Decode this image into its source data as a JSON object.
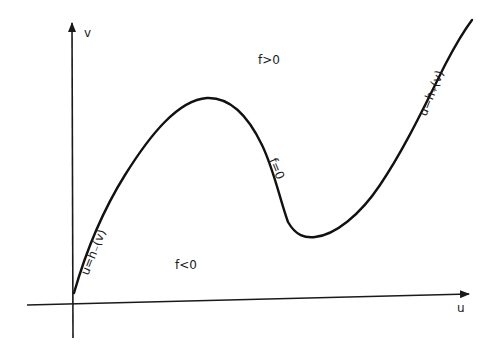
{
  "figure": {
    "axes": {
      "x_label": "u",
      "y_label": "v"
    },
    "curve": {
      "name": "f=0 nullcline (cubic-shaped)",
      "label": "f=0",
      "left_branch_label": "u=h₋(v)",
      "right_branch_label": "u=h₊(v)"
    },
    "regions": {
      "above": "f>0",
      "below": "f<0"
    },
    "colors": {
      "ink": "#1a1a1a",
      "background": "#ffffff"
    }
  }
}
